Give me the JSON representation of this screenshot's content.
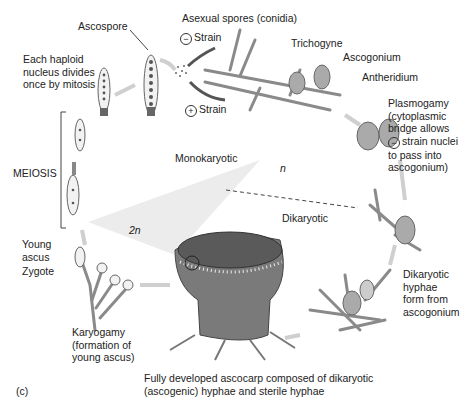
{
  "diagram": {
    "panel_label": "(c)",
    "phase_labels": {
      "monokaryotic": "Monokaryotic",
      "dikaryotic": "Dikaryotic",
      "haploid": "n",
      "diploid": "2n"
    },
    "labels": {
      "ascospore": "Ascospore",
      "asexual_spores": "Asexual spores (conidia)",
      "minus_strain": "Strain",
      "plus_strain": "Strain",
      "minus_symbol": "−",
      "plus_symbol": "+",
      "trichogyne": "Trichogyne",
      "ascogonium": "Ascogonium",
      "antheridium": "Antheridium",
      "mitosis": [
        "Each haploid",
        "nucleus divides",
        "once by mitosis"
      ],
      "meiosis": "MEIOSIS",
      "plasmogamy": [
        "Plasmogamy",
        "(cytoplasmic",
        "bridge allows",
        "strain nuclei",
        "to pass into",
        "ascogonium)"
      ],
      "young_ascus": [
        "Young",
        "ascus"
      ],
      "zygote": "Zygote",
      "karyogamy": [
        "Karyogamy",
        "(formation of",
        "young ascus)"
      ],
      "dikaryotic_hyphae": [
        "Dikaryotic",
        "hyphae",
        "form from",
        "ascogonium"
      ],
      "ascocarp": [
        "Fully developed ascocarp composed of dikaryotic",
        "(ascogenic) hyphae and sterile hyphae"
      ]
    },
    "colors": {
      "background": "#ffffff",
      "hyphae": "#8a8a8a",
      "arrow": "#c8c8c8",
      "dark_arrow": "#555555",
      "text": "#222222"
    }
  }
}
